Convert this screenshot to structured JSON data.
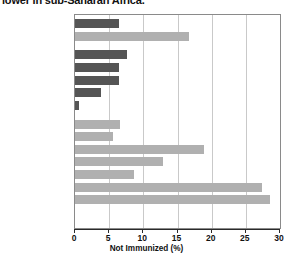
{
  "title_partial": "lower in sub-Saharan Africa.",
  "chart_data": {
    "type": "bar",
    "orientation": "horizontal",
    "title": "lower in sub-Saharan Africa.",
    "xlabel": "Not Immunized  (%)",
    "ylabel": "",
    "xlim": [
      0,
      30
    ],
    "xticks": [
      0,
      5,
      10,
      15,
      20,
      25,
      30
    ],
    "grid": true,
    "legend": "none",
    "colors": {
      "dark": "#555555",
      "light": "#b0b0b0",
      "frame": "#8a8a8a",
      "grid": "#c9c9c9"
    },
    "categories": [
      "Developed",
      "Developing",
      "North America",
      "Europe",
      "South Pacific",
      "Japan",
      "Russia",
      "Latin America",
      "East Asia",
      "Southwest Asia\nand North Africa",
      "Southeast Asia",
      "Central Asia",
      "South Asia",
      "Sub-Saharan Africa"
    ],
    "values": [
      6.4,
      16.7,
      7.6,
      6.4,
      6.4,
      3.8,
      0.6,
      6.6,
      5.6,
      18.9,
      12.9,
      8.6,
      27.4,
      28.5
    ],
    "shades": [
      "dark",
      "light",
      "dark",
      "dark",
      "dark",
      "dark",
      "dark",
      "light",
      "light",
      "light",
      "light",
      "light",
      "light",
      "light"
    ],
    "group_gaps_after": [
      1,
      6
    ]
  }
}
